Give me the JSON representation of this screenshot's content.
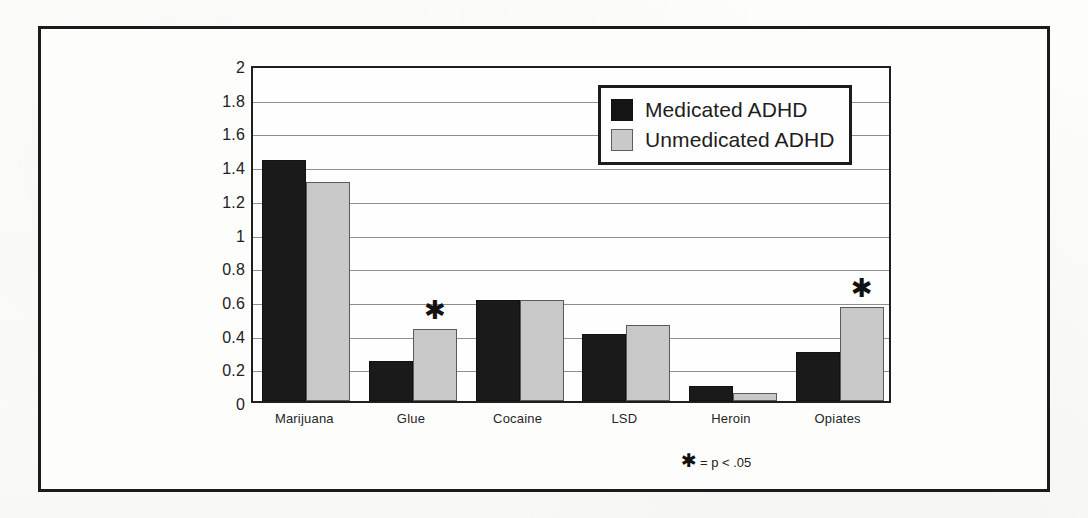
{
  "figure": {
    "footnote_star": "✱",
    "footnote_text": "= p < .05"
  },
  "legend": {
    "position": "inside-top-right",
    "entries": [
      {
        "label": "Medicated ADHD",
        "color": "#141414",
        "swatch": "medicated"
      },
      {
        "label": "Unmedicated ADHD",
        "color": "#c9c9c9",
        "swatch": "unmedicated"
      }
    ]
  },
  "chart_data": {
    "type": "bar",
    "title": "",
    "subtitle": "",
    "xlabel": "",
    "ylabel": "",
    "ylim": [
      0,
      2
    ],
    "ytick_step": 0.2,
    "yticks": [
      "0",
      "0.2",
      "0.4",
      "0.6",
      "0.8",
      "1",
      "1.2",
      "1.4",
      "1.6",
      "1.8",
      "2"
    ],
    "ytick_values": [
      0,
      0.2,
      0.4,
      0.6,
      0.8,
      1,
      1.2,
      1.4,
      1.6,
      1.8,
      2
    ],
    "grid": true,
    "grid_axis": "y",
    "categories": [
      "Marijuana",
      "Glue",
      "Cocaine",
      "LSD",
      "Heroin",
      "Opiates"
    ],
    "series": [
      {
        "name": "Medicated ADHD",
        "color": "#1a1a1a",
        "values": [
          1.43,
          0.24,
          0.6,
          0.4,
          0.09,
          0.29
        ]
      },
      {
        "name": "Unmedicated ADHD",
        "color": "#c8c8c8",
        "values": [
          1.3,
          0.43,
          0.6,
          0.45,
          0.05,
          0.56
        ]
      }
    ],
    "annotations": [
      {
        "symbol": "✱",
        "category": "Glue",
        "series": "Unmedicated ADHD",
        "meaning": "p < .05"
      },
      {
        "symbol": "✱",
        "category": "Opiates",
        "series": "Unmedicated ADHD",
        "meaning": "p < .05"
      }
    ]
  }
}
